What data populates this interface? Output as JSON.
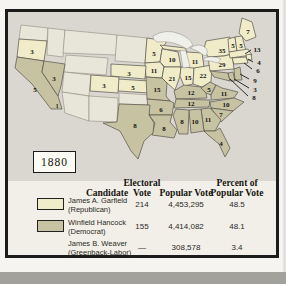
{
  "figure": {
    "year_label": "1880",
    "map": {
      "colors": {
        "republican": "#f0ecca",
        "democrat": "#c7c2a2",
        "territory": "#e8e6d8",
        "background": "#d9d7d0",
        "lake": "#f0f0ea"
      },
      "labels": [
        {
          "id": "or",
          "ev": "3",
          "party": "republican",
          "x": 24,
          "y": 39
        },
        {
          "id": "ca",
          "ev": "5",
          "party": "democrat",
          "x": 27,
          "y": 77
        },
        {
          "id": "ca-split",
          "ev": "1",
          "party": "republican",
          "x": 49,
          "y": 93,
          "small": true
        },
        {
          "id": "nv",
          "ev": "3",
          "party": "democrat",
          "x": 46,
          "y": 66
        },
        {
          "id": "co",
          "ev": "3",
          "party": "republican",
          "x": 96,
          "y": 73
        },
        {
          "id": "ne",
          "ev": "3",
          "party": "republican",
          "x": 121,
          "y": 61
        },
        {
          "id": "ks",
          "ev": "5",
          "party": "republican",
          "x": 125,
          "y": 75
        },
        {
          "id": "mn",
          "ev": "5",
          "party": "republican",
          "x": 146,
          "y": 41
        },
        {
          "id": "ia",
          "ev": "11",
          "party": "republican",
          "x": 146,
          "y": 58
        },
        {
          "id": "mo",
          "ev": "15",
          "party": "democrat",
          "x": 149,
          "y": 77
        },
        {
          "id": "wi",
          "ev": "10",
          "party": "republican",
          "x": 164,
          "y": 47
        },
        {
          "id": "il",
          "ev": "21",
          "party": "republican",
          "x": 164,
          "y": 66
        },
        {
          "id": "mi",
          "ev": "11",
          "party": "republican",
          "x": 187,
          "y": 49
        },
        {
          "id": "in",
          "ev": "15",
          "party": "republican",
          "x": 180,
          "y": 65
        },
        {
          "id": "oh",
          "ev": "22",
          "party": "republican",
          "x": 195,
          "y": 63
        },
        {
          "id": "ky",
          "ev": "12",
          "party": "democrat",
          "x": 183,
          "y": 80
        },
        {
          "id": "tn",
          "ev": "12",
          "party": "democrat",
          "x": 183,
          "y": 91
        },
        {
          "id": "wv",
          "ev": "5",
          "party": "democrat",
          "x": 201,
          "y": 77
        },
        {
          "id": "va",
          "ev": "11",
          "party": "democrat",
          "x": 216,
          "y": 81
        },
        {
          "id": "nc",
          "ev": "10",
          "party": "democrat",
          "x": 218,
          "y": 92
        },
        {
          "id": "sc",
          "ev": "7",
          "party": "democrat",
          "x": 213,
          "y": 102
        },
        {
          "id": "ga",
          "ev": "11",
          "party": "democrat",
          "x": 200,
          "y": 107
        },
        {
          "id": "al",
          "ev": "10",
          "party": "democrat",
          "x": 187,
          "y": 109
        },
        {
          "id": "ms",
          "ev": "8",
          "party": "democrat",
          "x": 174,
          "y": 109
        },
        {
          "id": "ar",
          "ev": "6",
          "party": "democrat",
          "x": 153,
          "y": 97
        },
        {
          "id": "la",
          "ev": "8",
          "party": "democrat",
          "x": 156,
          "y": 116
        },
        {
          "id": "tx",
          "ev": "8",
          "party": "democrat",
          "x": 127,
          "y": 113
        },
        {
          "id": "fl",
          "ev": "4",
          "party": "democrat",
          "x": 213,
          "y": 131
        },
        {
          "id": "ny",
          "ev": "35",
          "party": "republican",
          "x": 214,
          "y": 38
        },
        {
          "id": "pa",
          "ev": "29",
          "party": "republican",
          "x": 214,
          "y": 52
        },
        {
          "id": "me",
          "ev": "7",
          "party": "republican",
          "x": 240,
          "y": 19
        },
        {
          "id": "vt",
          "ev": "5",
          "party": "republican",
          "x": 225,
          "y": 33
        },
        {
          "id": "nh",
          "ev": "5",
          "party": "republican",
          "x": 233,
          "y": 33
        },
        {
          "id": "ma",
          "ev": "13",
          "party": "republican",
          "x": 249,
          "y": 37
        },
        {
          "id": "ri",
          "ev": "4",
          "party": "republican",
          "x": 251,
          "y": 50
        },
        {
          "id": "ct",
          "ev": "6",
          "party": "republican",
          "x": 250,
          "y": 58
        },
        {
          "id": "nj",
          "ev": "9",
          "party": "democrat",
          "x": 247,
          "y": 68
        },
        {
          "id": "de",
          "ev": "3",
          "party": "democrat",
          "x": 247,
          "y": 77
        },
        {
          "id": "md",
          "ev": "8",
          "party": "democrat",
          "x": 246,
          "y": 85
        }
      ]
    },
    "table": {
      "headers": [
        "Candidate",
        "Electoral Vote",
        "Popular Vote",
        "Percent of Popular Vote"
      ],
      "rows": [
        {
          "candidate": "James A. Garfield",
          "party": "(Republican)",
          "electoral": "214",
          "popular": "4,453,295",
          "percent": "48.5",
          "swatch": "republican"
        },
        {
          "candidate": "Winfield Hancock",
          "party": "(Democrat)",
          "electoral": "155",
          "popular": "4,414,082",
          "percent": "48.1",
          "swatch": "democrat"
        },
        {
          "candidate": "James B. Weaver",
          "party": "(Greenback-Labor)",
          "electoral": "—",
          "popular": "308,578",
          "percent": "3.4",
          "swatch": "none"
        }
      ]
    }
  }
}
